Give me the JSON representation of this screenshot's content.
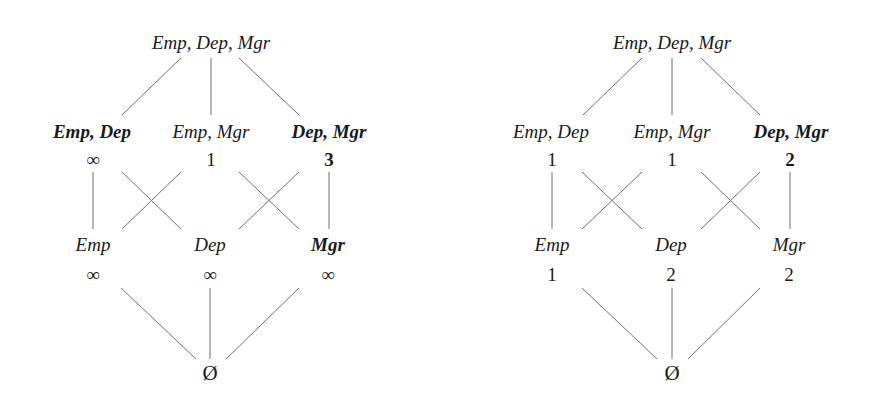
{
  "lattices": [
    {
      "name": "left-lattice",
      "top": {
        "label": "Emp, Dep, Mgr"
      },
      "level2": [
        {
          "label": "Emp, Dep",
          "value": "∞",
          "bold": true
        },
        {
          "label": "Emp, Mgr",
          "value": "1",
          "bold": false
        },
        {
          "label": "Dep, Mgr",
          "value": "3",
          "bold": true
        }
      ],
      "level3": [
        {
          "label": "Emp",
          "value": "∞",
          "bold": false
        },
        {
          "label": "Dep",
          "value": "∞",
          "bold": false
        },
        {
          "label": "Mgr",
          "value": "∞",
          "bold": true
        }
      ],
      "bottom": {
        "label": "Ø"
      }
    },
    {
      "name": "right-lattice",
      "top": {
        "label": "Emp, Dep, Mgr"
      },
      "level2": [
        {
          "label": "Emp, Dep",
          "value": "1",
          "bold": false
        },
        {
          "label": "Emp, Mgr",
          "value": "1",
          "bold": false
        },
        {
          "label": "Dep, Mgr",
          "value": "2",
          "bold": true
        }
      ],
      "level3": [
        {
          "label": "Emp",
          "value": "1",
          "bold": false
        },
        {
          "label": "Dep",
          "value": "2",
          "bold": false
        },
        {
          "label": "Mgr",
          "value": "2",
          "bold": false
        }
      ],
      "bottom": {
        "label": "Ø"
      }
    }
  ],
  "colors": {
    "line": "#6e6e6e",
    "text": "#1a1a1a",
    "background": "#ffffff"
  }
}
